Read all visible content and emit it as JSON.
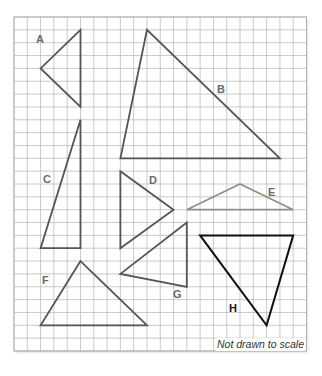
{
  "figure": {
    "caption_note": "Not drawn to scale",
    "grid": {
      "columns": 22,
      "rows": 26,
      "line_color": "#bdbdbd",
      "border_color": "#b0b0b0"
    },
    "colors": {
      "triangle_stroke": "#555555",
      "triangle_e_stroke": "#8f8f8f",
      "triangle_h_stroke": "#111111",
      "label": "#6a6a6a",
      "label_h": "#111111"
    },
    "triangles": [
      {
        "label": "A",
        "vertices": [
          [
            5,
            1
          ],
          [
            2,
            4
          ],
          [
            5,
            7
          ]
        ]
      },
      {
        "label": "B",
        "vertices": [
          [
            10,
            1
          ],
          [
            8,
            11
          ],
          [
            20,
            11
          ]
        ]
      },
      {
        "label": "C",
        "vertices": [
          [
            5,
            8
          ],
          [
            2,
            18
          ],
          [
            5,
            18
          ]
        ]
      },
      {
        "label": "D",
        "vertices": [
          [
            8,
            12
          ],
          [
            12,
            15
          ],
          [
            8,
            18
          ]
        ]
      },
      {
        "label": "E",
        "vertices": [
          [
            13,
            15
          ],
          [
            17,
            13
          ],
          [
            21,
            15
          ]
        ]
      },
      {
        "label": "F",
        "vertices": [
          [
            5,
            19
          ],
          [
            2,
            24
          ],
          [
            10,
            24
          ]
        ]
      },
      {
        "label": "G",
        "vertices": [
          [
            13,
            16
          ],
          [
            8,
            20
          ],
          [
            13,
            21
          ]
        ]
      },
      {
        "label": "H",
        "vertices": [
          [
            14,
            17
          ],
          [
            21,
            17
          ],
          [
            19,
            24
          ]
        ]
      }
    ],
    "labels": {
      "A": "A",
      "B": "B",
      "C": "C",
      "D": "D",
      "E": "E",
      "F": "F",
      "G": "G",
      "H": "H"
    }
  }
}
